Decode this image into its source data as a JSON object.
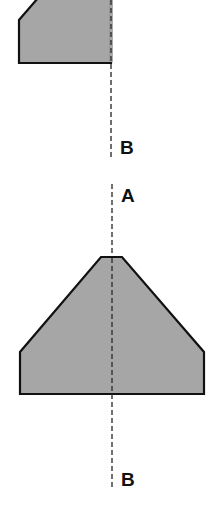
{
  "diagram": {
    "type": "section-view-cut-lines",
    "colors": {
      "shape_fill": "#a6a6a6",
      "outline": "#111111",
      "axis_line": "#333333",
      "background": "#ffffff"
    },
    "upper_view": {
      "description": "Half-section cut along axis, truncated shape (partial, cut off at top)",
      "cut_label_bottom": "B"
    },
    "lower_view": {
      "description": "Full symmetric profile: narrow flat top, sloped sides, vertical walls, flat base",
      "cut_label_top": "A",
      "cut_label_bottom": "B"
    }
  }
}
